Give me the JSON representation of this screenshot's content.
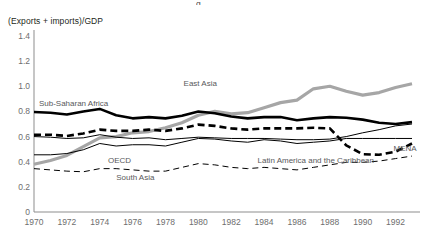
{
  "axis_title": "(Exports + imports)/GDP",
  "clipped_top_fragment": "g",
  "chart_data": {
    "type": "line",
    "title": "",
    "subtitle": "",
    "xlabel": "",
    "ylabel": "(Exports + imports)/GDP",
    "ylim": [
      0,
      1.4
    ],
    "xlim": [
      1970,
      1993
    ],
    "yticks": [
      "1.4",
      "1.2",
      "1.0",
      "0.8",
      "0.6",
      "0.4",
      "0.2",
      "0"
    ],
    "ytick_values": [
      1.4,
      1.2,
      1.0,
      0.8,
      0.6,
      0.4,
      0.2,
      0
    ],
    "xticks": [
      "1970",
      "1972",
      "1974",
      "1976",
      "1978",
      "1980",
      "1982",
      "1984",
      "1986",
      "1988",
      "1990",
      "1992"
    ],
    "xtick_values": [
      1970,
      1972,
      1974,
      1976,
      1978,
      1980,
      1982,
      1984,
      1986,
      1988,
      1990,
      1992
    ],
    "grid": false,
    "legend": "inline-labels",
    "x": [
      1970,
      1971,
      1972,
      1973,
      1974,
      1975,
      1976,
      1977,
      1978,
      1979,
      1980,
      1981,
      1982,
      1983,
      1984,
      1985,
      1986,
      1987,
      1988,
      1989,
      1990,
      1991,
      1992,
      1993
    ],
    "series": [
      {
        "name": "East Asia",
        "color": "#a6a6a6",
        "style": "solid",
        "width": "thick",
        "label_x": 1979.1,
        "label_y": 1.01,
        "values": [
          0.38,
          0.41,
          0.45,
          0.52,
          0.59,
          0.6,
          0.63,
          0.64,
          0.67,
          0.71,
          0.77,
          0.8,
          0.78,
          0.79,
          0.83,
          0.87,
          0.89,
          0.98,
          1.0,
          0.96,
          0.93,
          0.95,
          0.99,
          1.02
        ]
      },
      {
        "name": "Sub-Saharan Africa",
        "color": "#000000",
        "style": "solid",
        "width": "thick",
        "label_x": 1970.3,
        "label_y": 0.855,
        "values": [
          0.795,
          0.79,
          0.775,
          0.8,
          0.82,
          0.77,
          0.745,
          0.755,
          0.745,
          0.765,
          0.8,
          0.785,
          0.76,
          0.745,
          0.755,
          0.755,
          0.73,
          0.745,
          0.755,
          0.75,
          0.735,
          0.71,
          0.7,
          0.715
        ]
      },
      {
        "name": "MENA",
        "color": "#000000",
        "style": "dashed",
        "width": "thick",
        "label_x": 1992.0,
        "label_y": 0.49,
        "values": [
          0.615,
          0.615,
          0.605,
          0.625,
          0.655,
          0.645,
          0.645,
          0.655,
          0.645,
          0.665,
          0.695,
          0.685,
          0.665,
          0.655,
          0.665,
          0.665,
          0.665,
          0.67,
          0.665,
          0.53,
          0.46,
          0.455,
          0.48,
          0.545
        ]
      },
      {
        "name": "Latin America and the Caribbean",
        "color": "#000000",
        "style": "solid",
        "width": "thin",
        "label_x": 1983.6,
        "label_y": 0.395,
        "values": [
          0.6,
          0.595,
          0.585,
          0.59,
          0.615,
          0.595,
          0.585,
          0.59,
          0.575,
          0.585,
          0.595,
          0.59,
          0.585,
          0.585,
          0.585,
          0.58,
          0.575,
          0.575,
          0.58,
          0.6,
          0.63,
          0.655,
          0.685,
          0.7
        ]
      },
      {
        "name": "OECD",
        "color": "#000000",
        "style": "solid",
        "width": "thin",
        "label_x": 1974.5,
        "label_y": 0.4,
        "values": [
          0.455,
          0.455,
          0.465,
          0.495,
          0.545,
          0.525,
          0.535,
          0.535,
          0.525,
          0.555,
          0.585,
          0.58,
          0.565,
          0.555,
          0.575,
          0.565,
          0.545,
          0.555,
          0.565,
          0.585,
          0.585,
          0.585,
          0.585,
          0.585
        ]
      },
      {
        "name": "South Asia",
        "color": "#000000",
        "style": "dashed",
        "width": "thin",
        "label_x": 1975.0,
        "label_y": 0.265,
        "values": [
          0.345,
          0.335,
          0.325,
          0.32,
          0.345,
          0.345,
          0.335,
          0.325,
          0.325,
          0.355,
          0.385,
          0.375,
          0.355,
          0.345,
          0.355,
          0.345,
          0.335,
          0.355,
          0.375,
          0.395,
          0.395,
          0.405,
          0.425,
          0.445
        ]
      }
    ]
  }
}
